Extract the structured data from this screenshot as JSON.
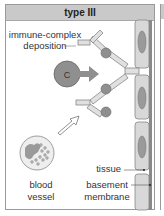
{
  "title": "type III",
  "labels": {
    "immune_complex_line1": "immune-complex",
    "immune_complex_line2": "deposition",
    "complement": "C",
    "tissue": "tissue",
    "basement_line1": "basement",
    "basement_line2": "membrane",
    "blood_line1": "blood",
    "blood_line2": "vessel"
  },
  "colors": {
    "header_bg": "#c9c9c9",
    "antibody_fill": "#e0e0e0",
    "antigen_fill": "#8f8f8f",
    "cell_fill": "#d8d8d8",
    "nucleus_fill": "#9a9a9a",
    "membrane": "#7a7a7a"
  }
}
